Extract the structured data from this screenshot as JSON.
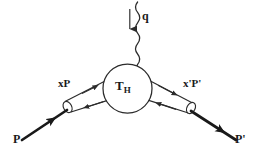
{
  "figure": {
    "type": "feynman-diagram",
    "title": "",
    "background_color": "#ffffff",
    "line_color": "#2b2b2b",
    "text_color": "#1a1a1a",
    "width": 259,
    "height": 161
  },
  "labels": {
    "photon_momentum": "q",
    "left_parton": "xP",
    "right_parton": "x'P'",
    "incoming_hadron": "P",
    "outgoing_hadron": "P'",
    "hard_scattering_main": "T",
    "hard_scattering_sub": "H"
  },
  "elements": {
    "photon": {
      "name": "wavy-photon-line",
      "style": "wavy",
      "direction": "downward",
      "arrow": "down"
    },
    "blob": {
      "name": "hard-scattering-blob",
      "shape": "circle",
      "cx": 127.5,
      "cy": 88.5,
      "r": 24.5
    },
    "left_tube": {
      "name": "left-parton-tube",
      "ellipse_cx": 67.5,
      "ellipse_cy": 107.0,
      "upper_arrow": "toward-blob",
      "lower_arrow": "away-from-blob"
    },
    "right_tube": {
      "name": "right-parton-tube",
      "ellipse_cx": 191.0,
      "ellipse_cy": 108.0,
      "upper_arrow": "away-from-blob",
      "lower_arrow": "toward-blob"
    },
    "left_hadron_line": {
      "name": "incoming-hadron-line",
      "thick": true,
      "arrow": "toward-upper-right"
    },
    "right_hadron_line": {
      "name": "outgoing-hadron-line",
      "thick": true,
      "arrow": "toward-lower-right"
    }
  }
}
